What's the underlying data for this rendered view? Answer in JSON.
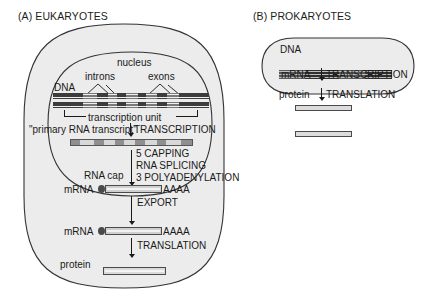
{
  "figure": {
    "background_color": "#ffffff",
    "ink_color": "#1a1a1a",
    "cell_fill": "#ececec"
  },
  "panel_a": {
    "title": "(A) EUKARYOTES",
    "compartment_label": "nucleus",
    "labels": {
      "dna": "DNA",
      "introns": "introns",
      "exons": "exons",
      "transcription_unit": "transcription unit",
      "primary_transcript": "\"primary RNA transcript\"",
      "rna_cap": "RNA cap",
      "mrna_nuclear": "mRNA",
      "poly_a_nuclear": "AAAA",
      "mrna_cytosolic": "mRNA",
      "poly_a_cytosolic": "AAAA",
      "protein": "protein"
    },
    "steps": {
      "transcription": "TRANSCRIPTION",
      "processing": [
        "5 CAPPING",
        "RNA SPLICING",
        "3 POLYADENYLATION"
      ],
      "export": "EXPORT",
      "translation": "TRANSLATION"
    }
  },
  "panel_b": {
    "title": "(B) PROKARYOTES",
    "labels": {
      "dna": "DNA",
      "mrna": "mRNA",
      "protein": "protein"
    },
    "steps": {
      "transcription": "TRANSCRIPTION",
      "translation": "TRANSLATION"
    }
  }
}
